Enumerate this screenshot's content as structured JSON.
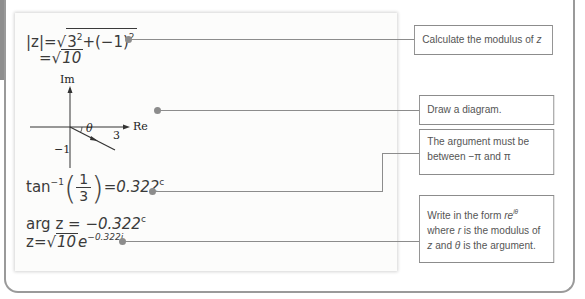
{
  "worked_example": {
    "steps": {
      "modulus_lhs": "|z|",
      "eq": "=",
      "modulus_radicand_a": "3",
      "modulus_radicand_a_exp": "2",
      "modulus_radicand_plus": "+(−1)",
      "modulus_radicand_b_exp": "2",
      "modulus_result_radicand": "10",
      "arctan_func": "tan",
      "arctan_exp": "−1",
      "arctan_num": "1",
      "arctan_den": "3",
      "arctan_value": "0.322",
      "arctan_unit": "c",
      "arg_lhs": "arg z",
      "arg_value": "−0.322",
      "arg_unit": "c",
      "final_lhs": "z",
      "final_radicand": "10",
      "final_base": "e",
      "final_exponent": "−0.322i"
    },
    "diagram": {
      "im_label": "Im",
      "re_label": "Re",
      "theta_label": "θ",
      "x_label": "3",
      "y_label": "−1"
    }
  },
  "notes": [
    {
      "text": "Calculate the modulus of ",
      "italic": "z"
    },
    {
      "text": "Draw a diagram."
    },
    {
      "text": "The argument must be between −π and π"
    },
    {
      "line1": "Write in the form ",
      "line1_italic": "re",
      "line1_sup": "iθ",
      "line2_italic": "r",
      "line2": " is the modulus of",
      "line2_prefix": "where ",
      "line3_italic_z": "z",
      "line3_mid": " and ",
      "line3_italic_theta": "θ",
      "line3": " is the argument."
    }
  ],
  "colors": {
    "connector": "#8c8c8c",
    "frame": "#9a9a9a",
    "panel_bg": "#fcfcfb"
  }
}
